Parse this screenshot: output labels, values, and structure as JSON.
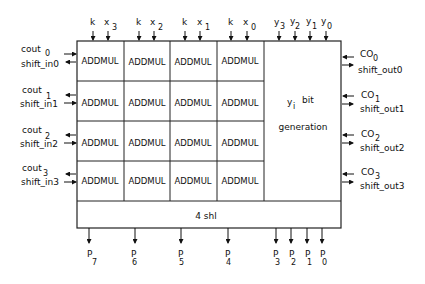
{
  "diagram": {
    "top_inputs": [
      {
        "k": "k",
        "x": "x",
        "sub": "3"
      },
      {
        "k": "k",
        "x": "x",
        "sub": "2"
      },
      {
        "k": "k",
        "x": "x",
        "sub": "1"
      },
      {
        "k": "k",
        "x": "x",
        "sub": "0"
      }
    ],
    "y_inputs": [
      {
        "base": "y",
        "sub": "3"
      },
      {
        "base": "y",
        "sub": "2"
      },
      {
        "base": "y",
        "sub": "1"
      },
      {
        "base": "y",
        "sub": "0"
      }
    ],
    "cell_label": "ADDMUL",
    "ybit_block": {
      "line1_base": "y",
      "line1_sub": "i",
      "line1_rest": "bit",
      "line2": "generation"
    },
    "shift_block": "4 shl",
    "left_ports": [
      {
        "cout": "cout",
        "cout_sub": "0",
        "shift": "shift_in0"
      },
      {
        "cout": "cout",
        "cout_sub": "1",
        "shift": "shift_in1"
      },
      {
        "cout": "cout",
        "cout_sub": "2",
        "shift": "shift_in2"
      },
      {
        "cout": "cout",
        "cout_sub": "3",
        "shift": "shift_in3"
      }
    ],
    "right_ports": [
      {
        "co": "CO",
        "co_sub": "0",
        "shift": "shift_out0"
      },
      {
        "co": "CO",
        "co_sub": "1",
        "shift": "shift_out1"
      },
      {
        "co": "CO",
        "co_sub": "2",
        "shift": "shift_out2"
      },
      {
        "co": "CO",
        "co_sub": "3",
        "shift": "shift_out3"
      }
    ],
    "outputs": [
      {
        "base": "P",
        "sub": "7"
      },
      {
        "base": "P",
        "sub": "6"
      },
      {
        "base": "P",
        "sub": "5"
      },
      {
        "base": "P",
        "sub": "4"
      },
      {
        "base": "P",
        "sub": "3"
      },
      {
        "base": "P",
        "sub": "2"
      },
      {
        "base": "P",
        "sub": "1"
      },
      {
        "base": "P",
        "sub": "0"
      }
    ]
  }
}
